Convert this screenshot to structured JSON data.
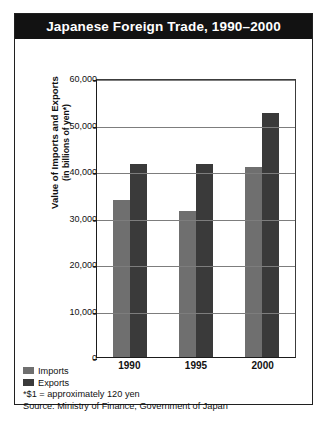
{
  "figure": {
    "title": "Japanese Foreign Trade, 1990–2000",
    "legend": [
      {
        "label": "Imports",
        "color": "#6f6f6f"
      },
      {
        "label": "Exports",
        "color": "#3a3a3a"
      }
    ],
    "footnotes": [
      "*$1 = approximately 120 yen",
      "Source: Ministry of Finance, Government of Japan"
    ],
    "axis_title_line1": "Value of Imports and Exports",
    "axis_title_line2": "(in billions of yen*)"
  },
  "chart_data": {
    "type": "bar",
    "title": "Japanese Foreign Trade, 1990–2000",
    "xlabel": "",
    "ylabel": "Value of Imports and Exports (in billions of yen*)",
    "categories": [
      "1990",
      "1995",
      "2000"
    ],
    "series": [
      {
        "name": "Imports",
        "color": "#6f6f6f",
        "values": [
          33800,
          31500,
          40900
        ]
      },
      {
        "name": "Exports",
        "color": "#3a3a3a",
        "values": [
          41500,
          41600,
          52400
        ]
      }
    ],
    "ylim": [
      0,
      60000
    ],
    "yticks": [
      0,
      10000,
      20000,
      30000,
      40000,
      50000,
      60000
    ],
    "ytick_labels": [
      "0",
      "10,000",
      "20,000",
      "30,000",
      "40,000",
      "50,000",
      "60,000"
    ],
    "grid": true,
    "legend_position": "below-left",
    "note": "*$1 = approximately 120 yen",
    "source": "Source: Ministry of Finance, Government of Japan"
  }
}
